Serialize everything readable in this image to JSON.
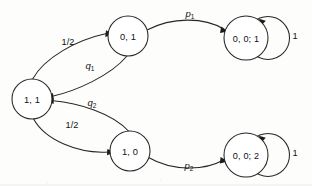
{
  "diagram": {
    "type": "state-transition-diagram",
    "background_color": "#fdfdfc",
    "stroke_color": "#262626",
    "text_color": "#111111",
    "states": [
      {
        "id": "s11",
        "label": "1, 1",
        "cx": 32,
        "cy": 99,
        "r": 20
      },
      {
        "id": "s01",
        "label": "0, 1",
        "cx": 128,
        "cy": 36,
        "r": 20
      },
      {
        "id": "s10",
        "label": "1, 0",
        "cx": 130,
        "cy": 151,
        "r": 20
      },
      {
        "id": "s001",
        "label": "0, 0; 1",
        "cx": 246,
        "cy": 38,
        "r": 22
      },
      {
        "id": "s002",
        "label": "0, 0; 2",
        "cx": 246,
        "cy": 155,
        "r": 22
      }
    ],
    "transitions": [
      {
        "id": "t1",
        "from": "s11",
        "to": "s01",
        "label": "1/2",
        "label_x": 68,
        "label_y": 42,
        "italic": false
      },
      {
        "id": "t2",
        "from": "s01",
        "to": "s11",
        "label": "q",
        "sub": "1",
        "label_x": 90,
        "label_y": 65,
        "italic": true
      },
      {
        "id": "t3",
        "from": "s01",
        "to": "s001",
        "label": "p",
        "sub": "1",
        "label_x": 190,
        "label_y": 13,
        "italic": true
      },
      {
        "id": "t4",
        "from": "s11",
        "to": "s10",
        "label": "1/2",
        "label_x": 72,
        "label_y": 125,
        "italic": false
      },
      {
        "id": "t5",
        "from": "s10",
        "to": "s11",
        "label": "q",
        "sub": "2",
        "label_x": 92,
        "label_y": 102,
        "italic": true
      },
      {
        "id": "t6",
        "from": "s10",
        "to": "s002",
        "label": "p",
        "sub": "2",
        "label_x": 189,
        "label_y": 165,
        "italic": true
      },
      {
        "id": "t7",
        "from": "s001",
        "to": "s001",
        "label": "1",
        "label_x": 295,
        "label_y": 36,
        "italic": false,
        "self_loop": true
      },
      {
        "id": "t8",
        "from": "s002",
        "to": "s002",
        "label": "1",
        "label_x": 295,
        "label_y": 153,
        "italic": false,
        "self_loop": true
      }
    ]
  }
}
